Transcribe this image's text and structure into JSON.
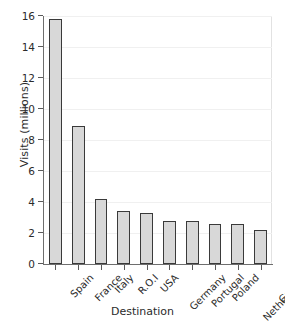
{
  "chart_data": {
    "type": "bar",
    "title": "",
    "xlabel": "Destination",
    "ylabel": "Visits (millions)",
    "categories": [
      "Spain",
      "France",
      "Italy",
      "R.O.I",
      "USA",
      "Germany",
      "Portugal",
      "Poland",
      "Netherlands",
      "Greece"
    ],
    "values": [
      15.8,
      8.9,
      4.2,
      3.4,
      3.3,
      2.8,
      2.75,
      2.6,
      2.6,
      2.2
    ],
    "ylim": [
      0,
      16
    ],
    "yticks": [
      0,
      2,
      4,
      6,
      8,
      10,
      12,
      14,
      16
    ],
    "ytick_labels": [
      "0",
      "2",
      "4",
      "6",
      "8",
      "10",
      "12",
      "14",
      "16"
    ],
    "grid": true,
    "legend": "none",
    "bar_fill_color": "#d8d8d8",
    "bar_edge_color": "#3a3a3a",
    "background_color": "#ffffff",
    "axis_color": "#6e6e6e",
    "gridline_color": "#f0f0f0",
    "text_color": "#2b2b2b",
    "xlabel_rotation_degrees": 45
  }
}
